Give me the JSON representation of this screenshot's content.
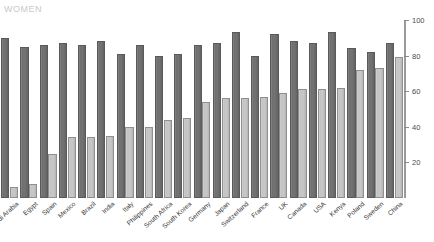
{
  "watermark": {
    "text": "WOMEN"
  },
  "chart_data": {
    "type": "bar",
    "title": "",
    "subtitle": "",
    "xlabel": "",
    "ylabel": "",
    "ylim": [
      0,
      100
    ],
    "yticks": [
      20,
      40,
      60,
      80,
      100
    ],
    "grid": false,
    "legend_position": "none",
    "axis_position": "right",
    "categories": [
      "Saudi Arabia",
      "Egypt",
      "Spain",
      "Mexico",
      "Brazil",
      "India",
      "Italy",
      "Philippines",
      "South Africa",
      "South Korea",
      "Germany",
      "Japan",
      "Switzerland",
      "France",
      "UK",
      "Canada",
      "USA",
      "Kenya",
      "Poland",
      "Sweden",
      "China"
    ],
    "series": [
      {
        "name": "Men",
        "color": "#6f6f6f",
        "values": [
          90,
          85,
          86,
          87,
          86,
          88,
          81,
          86,
          80,
          81,
          86,
          87,
          93,
          80,
          92,
          88,
          87,
          93,
          84,
          82,
          87
        ]
      },
      {
        "name": "Women",
        "color": "#c3c3c3",
        "values": [
          6,
          8,
          25,
          34,
          34,
          35,
          40,
          40,
          44,
          45,
          54,
          56,
          56,
          57,
          59,
          61,
          61,
          62,
          72,
          73,
          79
        ]
      }
    ]
  }
}
